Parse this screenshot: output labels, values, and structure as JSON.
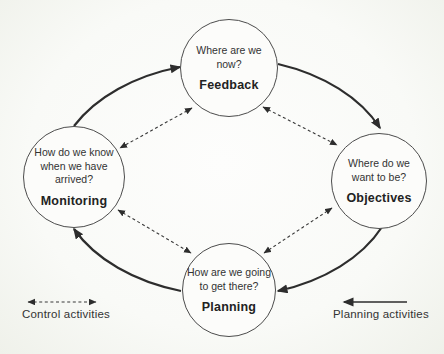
{
  "colors": {
    "ink": "#2d2d2d",
    "paper": "#fcfcfa",
    "circle_stroke": "#4c4c4c"
  },
  "nodes": {
    "feedback": {
      "lines": [
        "Where are we",
        "now?"
      ],
      "label": "Feedback"
    },
    "objectives": {
      "lines": [
        "Where do we",
        "want to be?"
      ],
      "label": "Objectives"
    },
    "planning": {
      "lines": [
        "How are we going",
        "to get there?"
      ],
      "label": "Planning"
    },
    "monitoring": {
      "lines": [
        "How do we know",
        "when we have",
        "arrived?"
      ],
      "label": "Monitoring"
    }
  },
  "flows": {
    "solid_cycle": [
      "Monitoring to Feedback",
      "Feedback to Objectives",
      "Objectives to Planning",
      "Planning to Monitoring"
    ],
    "dashed_bidirectional": [
      "Feedback and Monitoring",
      "Feedback and Objectives",
      "Monitoring and Planning",
      "Objectives and Planning"
    ]
  },
  "legend": {
    "control": "Control activities",
    "planning": "Planning activities"
  }
}
